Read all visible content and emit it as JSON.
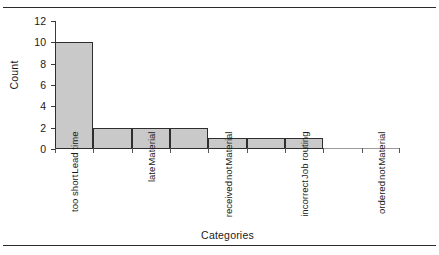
{
  "chart_data": {
    "type": "bar",
    "title": "",
    "subtitle": "",
    "xlabel": "Categories",
    "ylabel": "Count",
    "ylim": [
      0,
      12
    ],
    "yticks": [
      0,
      2,
      4,
      6,
      8,
      10,
      12
    ],
    "ytick_labels": [
      "0",
      "2",
      "4",
      "6",
      "8",
      "10",
      "12"
    ],
    "grid": false,
    "legend": null,
    "bar_fill_color": "#c9c9c9",
    "bar_edge_color": "#2e2e2e",
    "axis_color": "#3a3a3a",
    "bin_values": [
      10,
      2,
      2,
      2,
      1,
      1,
      1,
      0,
      0
    ],
    "categories": [
      "Lead time too short",
      "Material late",
      "Material not received",
      "Job routing incorrect",
      "Material not ordered"
    ],
    "values": [
      10,
      2,
      2,
      1,
      0
    ],
    "category_label_lines": [
      [
        "Lead time",
        "too short"
      ],
      [
        "Material",
        "late"
      ],
      [
        "Material",
        "not",
        "received"
      ],
      [
        "Job routing",
        "incorrect"
      ],
      [
        "Material",
        "not",
        "ordered"
      ]
    ],
    "annotations": []
  },
  "figure": {
    "top_rule": "",
    "bottom_rule": ""
  }
}
